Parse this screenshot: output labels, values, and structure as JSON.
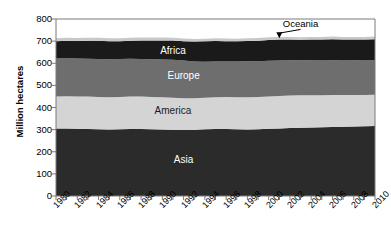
{
  "chart_data": {
    "type": "area",
    "stacked": true,
    "title": "",
    "xlabel": "",
    "ylabel": "Million hectares",
    "ylim": [
      0,
      800
    ],
    "xlim": [
      1980,
      2010
    ],
    "ytick_values": [
      0,
      100,
      200,
      300,
      400,
      500,
      600,
      700,
      800
    ],
    "ytick_labels": [
      "0",
      "100",
      "200",
      "300",
      "400",
      "500",
      "600",
      "700",
      "800"
    ],
    "x": [
      1980,
      1981,
      1982,
      1983,
      1984,
      1985,
      1986,
      1987,
      1988,
      1989,
      1990,
      1991,
      1992,
      1993,
      1994,
      1995,
      1996,
      1997,
      1998,
      1999,
      2000,
      2001,
      2002,
      2003,
      2004,
      2005,
      2006,
      2007,
      2008,
      2009,
      2010
    ],
    "xtick_values": [
      1980,
      1982,
      1984,
      1986,
      1988,
      1990,
      1992,
      1994,
      1996,
      1998,
      2000,
      2002,
      2004,
      2006,
      2008,
      2010
    ],
    "xtick_labels": [
      "1980",
      "1982",
      "1984",
      "1986",
      "1988",
      "1990",
      "1992",
      "1994",
      "1996",
      "1998",
      "2000",
      "2002",
      "2004",
      "2006",
      "2008",
      "2010"
    ],
    "grid": false,
    "legend": "inline-labels",
    "series": [
      {
        "name": "Asia",
        "color": "#2b2b2b",
        "label_color": "#ffffff",
        "values": [
          305,
          305,
          304,
          303,
          302,
          301,
          302,
          303,
          303,
          302,
          301,
          300,
          299,
          300,
          302,
          303,
          303,
          302,
          301,
          302,
          304,
          305,
          307,
          309,
          310,
          311,
          312,
          313,
          314,
          315,
          316
        ]
      },
      {
        "name": "America",
        "color": "#d4d4d4",
        "label_color": "#1a1a1a",
        "values": [
          145,
          146,
          146,
          147,
          146,
          145,
          146,
          147,
          147,
          146,
          145,
          144,
          143,
          142,
          142,
          143,
          144,
          144,
          145,
          145,
          146,
          147,
          147,
          146,
          145,
          144,
          144,
          143,
          143,
          142,
          142
        ]
      },
      {
        "name": "Europe",
        "color": "#6e6e6e",
        "label_color": "#ffffff",
        "values": [
          172,
          172,
          171,
          170,
          171,
          172,
          171,
          170,
          169,
          170,
          171,
          172,
          170,
          166,
          163,
          162,
          161,
          162,
          163,
          162,
          161,
          160,
          159,
          158,
          158,
          157,
          157,
          156,
          156,
          155,
          155
        ]
      },
      {
        "name": "Africa",
        "color": "#1a1a1a",
        "label_color": "#ffffff",
        "values": [
          78,
          79,
          80,
          82,
          83,
          82,
          81,
          82,
          84,
          85,
          86,
          87,
          88,
          90,
          92,
          93,
          92,
          91,
          92,
          93,
          94,
          95,
          94,
          93,
          94,
          95,
          96,
          95,
          94,
          95,
          96
        ]
      },
      {
        "name": "Oceania",
        "color": "#c8c8c8",
        "label_color": "#000000",
        "values": [
          13,
          13,
          13,
          13,
          13,
          13,
          13,
          13,
          13,
          13,
          13,
          12,
          12,
          12,
          12,
          12,
          12,
          12,
          12,
          12,
          12,
          12,
          12,
          12,
          12,
          12,
          12,
          12,
          12,
          12,
          12
        ]
      }
    ],
    "series_inline_labels": [
      {
        "name": "Africa",
        "x": 1991,
        "y": 660,
        "color": "#ffffff"
      },
      {
        "name": "Europe",
        "x": 1992,
        "y": 545,
        "color": "#ffffff"
      },
      {
        "name": "America",
        "x": 1991,
        "y": 390,
        "color": "#1a1a1a"
      },
      {
        "name": "Asia",
        "x": 1992,
        "y": 165,
        "color": "#ffffff"
      }
    ],
    "annotations": [
      {
        "text": "Oceania",
        "label_x": 2003,
        "label_y": 780,
        "arrow_to_x": 2001,
        "arrow_to_y": 718
      }
    ],
    "axis_color": "#7a7a7a",
    "text_color": "#000000",
    "background": "#ffffff"
  }
}
